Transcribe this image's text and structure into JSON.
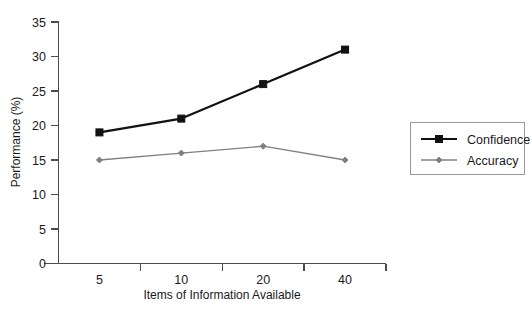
{
  "chart_data": {
    "type": "line",
    "title": "",
    "xlabel": "Items of Information Available",
    "ylabel": "Performance (%)",
    "categories": [
      "5",
      "10",
      "20",
      "40"
    ],
    "series": [
      {
        "name": "Confidence",
        "values": [
          19,
          21,
          26,
          31
        ],
        "color": "#111111",
        "marker": "square",
        "line_width": 2.2,
        "marker_size": 7
      },
      {
        "name": "Accuracy",
        "values": [
          15,
          16,
          17,
          15
        ],
        "color": "#808080",
        "marker": "diamond",
        "line_width": 1.3,
        "marker_size": 6
      }
    ],
    "ylim": [
      0,
      35
    ],
    "yticks": [
      0,
      5,
      10,
      15,
      20,
      25,
      30,
      35
    ],
    "ytick_labels": [
      "0",
      "5",
      "10",
      "15",
      "20",
      "25",
      "30",
      "35"
    ],
    "grid": false,
    "legend_position": "right"
  },
  "axes": {
    "y_title": "Performance (%)",
    "x_title": "Items of Information Available"
  },
  "legend": {
    "entries": [
      {
        "label": "Confidence"
      },
      {
        "label": "Accuracy"
      }
    ]
  },
  "colors": {
    "confidence": "#111111",
    "accuracy": "#808080",
    "axis": "#4d4d4d",
    "legend_border": "#999999",
    "background": "#ffffff"
  }
}
